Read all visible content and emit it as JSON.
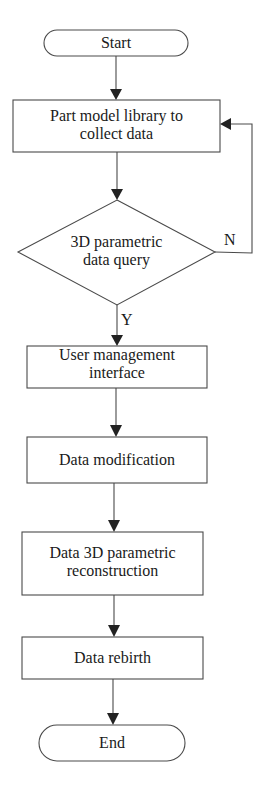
{
  "diagram": {
    "type": "flowchart",
    "colors": {
      "stroke": "#4a4a4a",
      "arrow": "#222222",
      "text": "#1a1a1a",
      "background": "#ffffff"
    },
    "nodes": [
      {
        "id": "start",
        "shape": "terminal",
        "label": "Start"
      },
      {
        "id": "collect",
        "shape": "process",
        "label_line1": "Part model library to",
        "label_line2": "collect data"
      },
      {
        "id": "query",
        "shape": "decision",
        "label_line1": "3D parametric",
        "label_line2": "data query"
      },
      {
        "id": "ui",
        "shape": "process",
        "label_line1": "User management",
        "label_line2": "interface"
      },
      {
        "id": "modify",
        "shape": "process",
        "label": "Data modification"
      },
      {
        "id": "reconstruct",
        "shape": "process",
        "label_line1": "Data 3D parametric",
        "label_line2": "reconstruction"
      },
      {
        "id": "rebirth",
        "shape": "process",
        "label": "Data rebirth"
      },
      {
        "id": "end",
        "shape": "terminal",
        "label": "End"
      }
    ],
    "edges": [
      {
        "from": "start",
        "to": "collect"
      },
      {
        "from": "collect",
        "to": "query"
      },
      {
        "from": "query",
        "to": "ui",
        "label": "Y"
      },
      {
        "from": "query",
        "to": "collect",
        "label": "N"
      },
      {
        "from": "ui",
        "to": "modify"
      },
      {
        "from": "modify",
        "to": "reconstruct"
      },
      {
        "from": "reconstruct",
        "to": "rebirth"
      },
      {
        "from": "rebirth",
        "to": "end"
      }
    ]
  }
}
